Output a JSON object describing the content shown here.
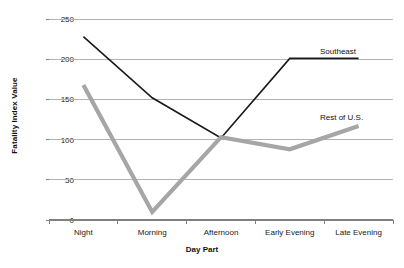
{
  "chart_data": {
    "type": "line",
    "title": "",
    "xlabel": "Day Part",
    "ylabel": "Fatality Index Value",
    "categories": [
      "Night",
      "Morning",
      "Afternoon",
      "Early Evening",
      "Late Evening"
    ],
    "ylim": [
      0,
      250
    ],
    "yticks": [
      0,
      50,
      100,
      150,
      200,
      250
    ],
    "ytick_labels": [
      "0",
      "50",
      "100",
      "150",
      "200",
      "250"
    ],
    "grid": true,
    "grid_axis": "y",
    "legend": "inline-right-labels",
    "series": [
      {
        "name": "Southeast",
        "values": [
          228,
          152,
          102,
          201,
          201
        ],
        "color": "#1a1a1a",
        "width": 1.6
      },
      {
        "name": "Rest of U.S.",
        "values": [
          168,
          10,
          103,
          88,
          117
        ],
        "color": "#a6a6a6",
        "width": 4.2
      }
    ],
    "annotations": [
      {
        "text": "Southeast",
        "series": "Southeast"
      },
      {
        "text": "Rest of U.S.",
        "series": "Rest of U.S."
      }
    ]
  },
  "style": {
    "background": "#ffffff",
    "grid_color": "#b3b3b3",
    "axis_color": "#808080",
    "text_color": "#1a1a1a"
  }
}
